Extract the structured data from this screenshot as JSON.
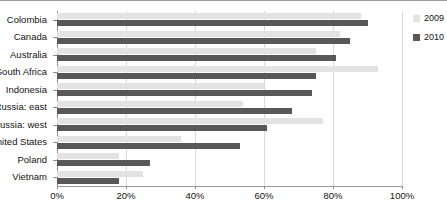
{
  "chart_data": {
    "type": "bar",
    "orientation": "horizontal",
    "title": "",
    "xlabel": "",
    "ylabel": "",
    "xlim": [
      0,
      100
    ],
    "xticks": [
      "0%",
      "20%",
      "40%",
      "60%",
      "80%",
      "100%"
    ],
    "xtick_values": [
      0,
      20,
      40,
      60,
      80,
      100
    ],
    "grid": true,
    "legend_position": "right",
    "categories": [
      "Colombia",
      "Canada",
      "Australia",
      "South Africa",
      "Indonesia",
      "Russia: east",
      "Russia: west",
      "United States",
      "Poland",
      "Vietnam"
    ],
    "series": [
      {
        "name": "2009",
        "color": "#e3e3e3",
        "values": [
          88,
          82,
          75,
          93,
          60,
          54,
          77,
          36,
          18,
          25
        ]
      },
      {
        "name": "2010",
        "color": "#585858",
        "values": [
          90,
          85,
          81,
          75,
          74,
          68,
          61,
          53,
          27,
          18
        ]
      }
    ]
  },
  "legend": {
    "items": [
      {
        "label": "2009",
        "color": "#e3e3e3"
      },
      {
        "label": "2010",
        "color": "#585858"
      }
    ]
  },
  "colors": {
    "series_2009": "#e3e3e3",
    "series_2010": "#585858",
    "gridline": "#d9d9d9",
    "axis": "#8d8d8d",
    "text": "#141414",
    "background": "#ffffff"
  }
}
